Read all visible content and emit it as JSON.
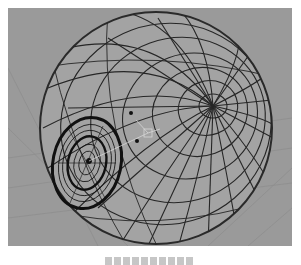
{
  "viewport": {
    "background": "#9a9a9a",
    "grid_color": "#8e8e8e",
    "wire_color": "#1e1e1e",
    "object": "wireframe-eyeball-sphere",
    "sphere": {
      "cx": 148,
      "cy": 120,
      "r": 116
    },
    "pole": {
      "x": 205,
      "y": 98
    },
    "iris": {
      "cx": 79,
      "cy": 155,
      "outer_rx": 34,
      "outer_ry": 46,
      "inner_rx": 19,
      "inner_ry": 27
    },
    "manipulator": {
      "x": 140,
      "y": 125
    }
  },
  "caption": {
    "text": ""
  }
}
